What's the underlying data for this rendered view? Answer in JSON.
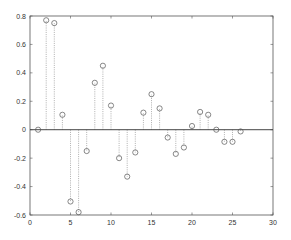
{
  "chart_data": {
    "type": "stem",
    "title": "",
    "xlabel": "",
    "ylabel": "",
    "xlim": [
      0,
      30
    ],
    "ylim": [
      -0.6,
      0.8
    ],
    "xticks": [
      0,
      5,
      10,
      15,
      20,
      25,
      30
    ],
    "yticks": [
      -0.6,
      -0.4,
      -0.2,
      0,
      0.2,
      0.4,
      0.6,
      0.8
    ],
    "xtick_labels": [
      "0",
      "5",
      "10",
      "15",
      "20",
      "25",
      "30"
    ],
    "ytick_labels": [
      "-0.6",
      "-0.4",
      "-0.2",
      "0",
      "0.2",
      "0.4",
      "0.6",
      "0.8"
    ],
    "grid": false,
    "baseline": 0,
    "marker": "circle-open",
    "stem_style": "dotted",
    "x": [
      1,
      2,
      3,
      4,
      5,
      6,
      7,
      8,
      9,
      10,
      11,
      12,
      13,
      14,
      15,
      16,
      17,
      18,
      19,
      20,
      21,
      22,
      23,
      24,
      25,
      26
    ],
    "y": [
      0.0,
      0.77,
      0.75,
      0.105,
      -0.505,
      -0.58,
      -0.15,
      0.33,
      0.45,
      0.17,
      -0.2,
      -0.33,
      -0.16,
      0.12,
      0.25,
      0.15,
      -0.055,
      -0.17,
      -0.125,
      0.026,
      0.125,
      0.105,
      0.0,
      -0.085,
      -0.085,
      -0.012
    ],
    "colors": {
      "axes": "#555555",
      "stem": "#9a9a9a",
      "marker": "#555555",
      "baseline": "#444444"
    }
  }
}
